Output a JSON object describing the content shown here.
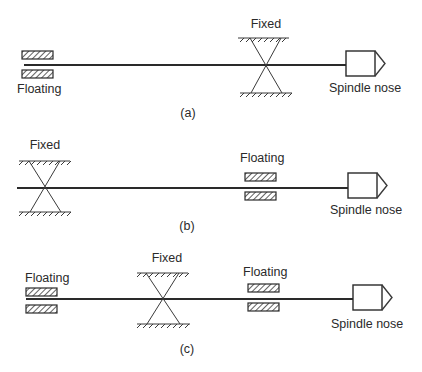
{
  "figure": {
    "panels": [
      {
        "caption": "(a)",
        "labels": {
          "floating": "Floating",
          "fixed": "Fixed",
          "spindle_nose": "Spindle nose"
        },
        "arrangement": [
          "Floating",
          "Fixed",
          "Spindle nose"
        ]
      },
      {
        "caption": "(b)",
        "labels": {
          "fixed": "Fixed",
          "floating": "Floating",
          "spindle_nose": "Spindle nose"
        },
        "arrangement": [
          "Fixed",
          "Floating",
          "Spindle nose"
        ]
      },
      {
        "caption": "(c)",
        "labels": {
          "floating_left": "Floating",
          "fixed": "Fixed",
          "floating_right": "Floating",
          "spindle_nose": "Spindle nose"
        },
        "arrangement": [
          "Floating",
          "Fixed",
          "Floating",
          "Spindle nose"
        ]
      }
    ],
    "symbols": {
      "floating_bearing": "hatched-rectangle-pair",
      "fixed_bearing": "crossed-lines-with-ground-hatch",
      "spindle_nose": "box-with-triangular-tip"
    },
    "colors": {
      "line": "#2a2a2a",
      "background": "#ffffff"
    }
  }
}
